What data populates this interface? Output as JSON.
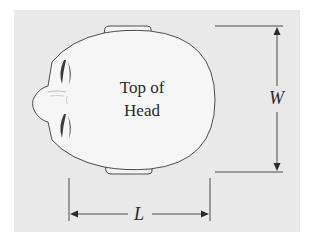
{
  "diagram": {
    "head_label_line1": "Top of",
    "head_label_line2": "Head",
    "width_label": "W",
    "length_label": "L"
  },
  "colors": {
    "background_panel": "#e9e9e9",
    "head_fill": "#f6f6f6",
    "stroke": "#3a3a3a"
  }
}
